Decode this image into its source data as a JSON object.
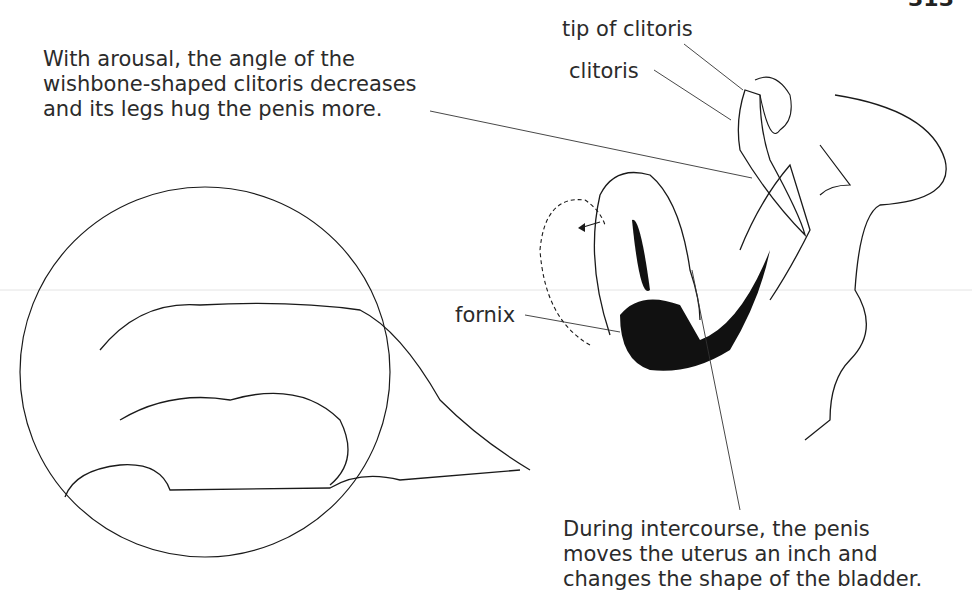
{
  "page": {
    "number": "313"
  },
  "captions": {
    "top": "With arousal, the angle of the\nwishbone-shaped clitoris decreases\nand its legs hug the penis more.",
    "bottom": "During intercourse, the penis\nmoves the uterus an inch and\nchanges the shape of the bladder."
  },
  "labels": {
    "tip_of_clitoris": "tip of clitoris",
    "clitoris": "clitoris",
    "fornix": "fornix"
  },
  "illustrations": {
    "vignette": "circular-vignette-couple-illustration",
    "cross_section": "anatomical-cross-section-illustration"
  },
  "colors": {
    "ink": "#1a1a1a",
    "text": "#2b2b2b",
    "background": "#ffffff"
  }
}
